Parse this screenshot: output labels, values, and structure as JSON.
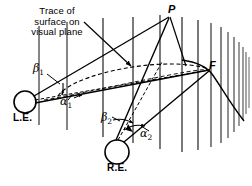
{
  "figure": {
    "type": "binocular-vision-geometry-diagram",
    "background_color": "#ffffff",
    "ink_color": "#000000",
    "width": 252,
    "height": 186
  },
  "annotation": {
    "trace_note": "Trace of\nsurface on\nvisual plane"
  },
  "points": {
    "P": "P",
    "F": "F",
    "left_eye": "L.E.",
    "right_eye": "R.E."
  },
  "angles": {
    "beta1": "β",
    "beta1_sub": "1",
    "alpha1": "α",
    "alpha1_sub": "1",
    "beta2": "β",
    "beta2_sub": "2",
    "alpha2": "α",
    "alpha2_sub": "2"
  },
  "geometry": {
    "left_eye_center": [
      25,
      102
    ],
    "left_eye_radius": 11,
    "right_eye_center": [
      117,
      152
    ],
    "right_eye_radius": 12,
    "point_P": [
      170,
      16
    ],
    "point_F": [
      210,
      70
    ],
    "vertical_lines_x": [
      39,
      67,
      103,
      133,
      160,
      182,
      198,
      211,
      221,
      228,
      234,
      239,
      243,
      246
    ],
    "dashed_ellipse_note": "trace of surface on visual plane",
    "solid_curve_note": "horopter / surface trace through F"
  }
}
